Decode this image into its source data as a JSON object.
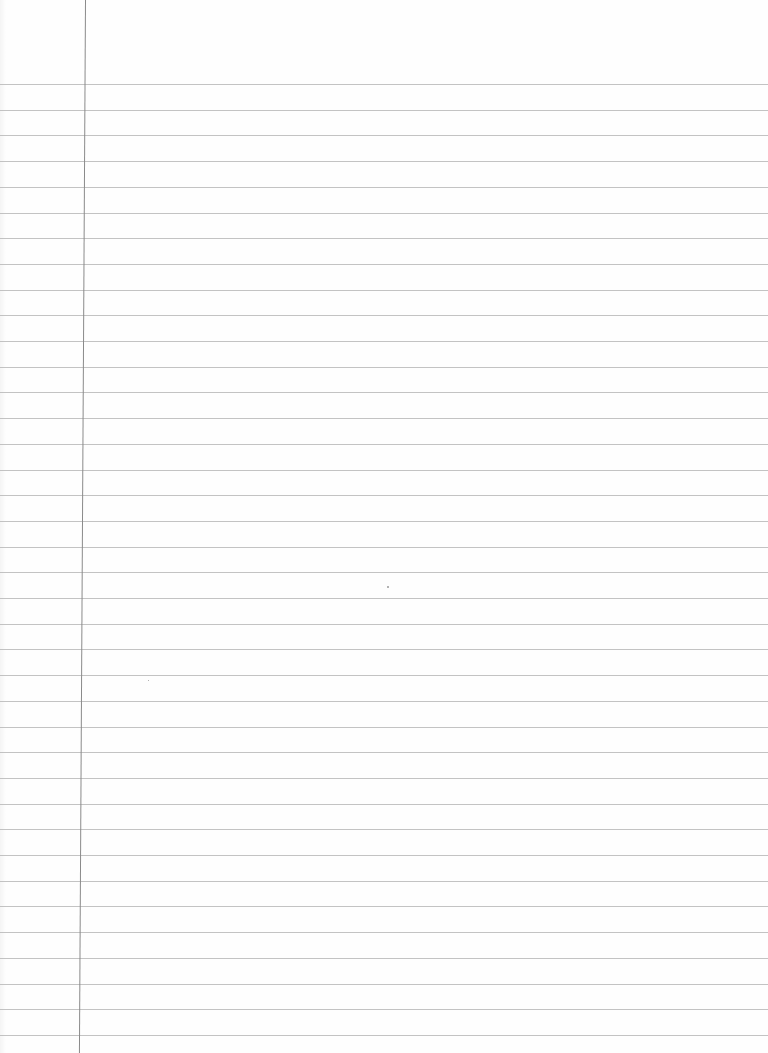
{
  "page": {
    "type": "ruled-notebook-paper",
    "background_color": "#fefefe",
    "rule_color": "#b9b9b9",
    "margin_line_color": "#8a8a8a",
    "first_rule_y": 84,
    "rule_spacing": 25.7,
    "rule_count": 38,
    "margin_line_x": 86,
    "text": ""
  }
}
